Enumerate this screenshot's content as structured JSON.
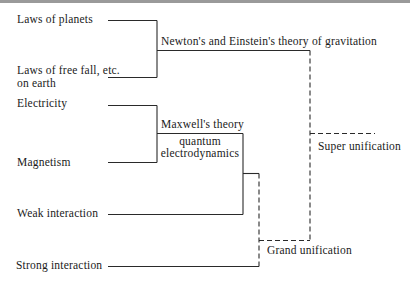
{
  "diagram": {
    "type": "tree",
    "leaves": [
      {
        "id": "planets",
        "label": "Laws of planets"
      },
      {
        "id": "freefall",
        "label_line1": "Laws of free fall, etc.",
        "label_line2": "on earth"
      },
      {
        "id": "electricity",
        "label": "Electricity"
      },
      {
        "id": "magnetism",
        "label": "Magnetism"
      },
      {
        "id": "weak",
        "label": "Weak interaction"
      },
      {
        "id": "strong",
        "label": "Strong interaction"
      }
    ],
    "nodes": [
      {
        "id": "gravitation",
        "label": "Newton's and Einstein's theory of gravitation",
        "children": [
          "planets",
          "freefall"
        ],
        "line_style": "solid"
      },
      {
        "id": "maxwell",
        "label": "Maxwell's theory",
        "sublabel_line1": "quantum",
        "sublabel_line2": "electrodynamics",
        "children": [
          "electricity",
          "magnetism"
        ],
        "line_style": "solid"
      },
      {
        "id": "electroweak",
        "label": "",
        "children": [
          "maxwell",
          "weak"
        ],
        "line_style": "solid"
      },
      {
        "id": "grand",
        "label": "Grand unification",
        "children": [
          "electroweak",
          "strong"
        ],
        "line_style": "dashed"
      },
      {
        "id": "super",
        "label": "Super unification",
        "children": [
          "gravitation",
          "grand"
        ],
        "line_style": "dashed"
      }
    ],
    "colors": {
      "line": "#2a2a2a",
      "text": "#1a1a1a",
      "top_border": "#9a9a9a",
      "background": "#ffffff"
    }
  }
}
